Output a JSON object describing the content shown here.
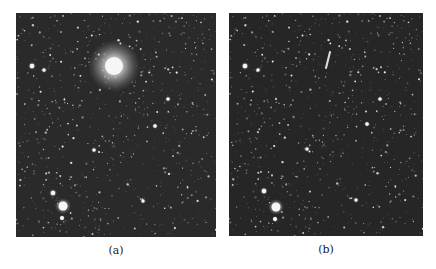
{
  "figure": {
    "panels": [
      {
        "id": "a",
        "caption": "(a)",
        "box": {
          "x": 16,
          "y": 13,
          "w": 200,
          "h": 224
        },
        "background": "#2a2a2a",
        "bright_sources": [
          {
            "x": 114,
            "y": 66,
            "r": 9,
            "glow": 26,
            "label": "bright-object"
          },
          {
            "x": 63,
            "y": 206,
            "r": 4.5,
            "glow": 8
          },
          {
            "x": 53,
            "y": 193,
            "r": 2.2,
            "glow": 4
          },
          {
            "x": 62,
            "y": 218,
            "r": 2.0,
            "glow": 3
          },
          {
            "x": 32,
            "y": 66,
            "r": 2.2,
            "glow": 4
          },
          {
            "x": 44,
            "y": 70,
            "r": 1.6,
            "glow": 3
          },
          {
            "x": 155,
            "y": 126,
            "r": 1.8,
            "glow": 3
          },
          {
            "x": 168,
            "y": 99,
            "r": 1.6,
            "glow": 3
          },
          {
            "x": 94,
            "y": 150,
            "r": 1.6,
            "glow": 3
          },
          {
            "x": 143,
            "y": 201,
            "r": 1.5,
            "glow": 3
          }
        ]
      },
      {
        "id": "b",
        "caption": "(b)",
        "box": {
          "x": 229,
          "y": 13,
          "w": 194,
          "h": 223
        },
        "background": "#262626",
        "bright_sources": [
          {
            "x": 276,
            "y": 207,
            "r": 4.5,
            "glow": 8
          },
          {
            "x": 264,
            "y": 191,
            "r": 2.2,
            "glow": 4
          },
          {
            "x": 275,
            "y": 219,
            "r": 2.0,
            "glow": 3
          },
          {
            "x": 245,
            "y": 66,
            "r": 2.2,
            "glow": 4
          },
          {
            "x": 258,
            "y": 70,
            "r": 1.6,
            "glow": 3
          },
          {
            "x": 367,
            "y": 124,
            "r": 1.8,
            "glow": 3
          },
          {
            "x": 380,
            "y": 99,
            "r": 1.6,
            "glow": 3
          },
          {
            "x": 307,
            "y": 149,
            "r": 1.6,
            "glow": 3
          },
          {
            "x": 356,
            "y": 200,
            "r": 1.5,
            "glow": 3
          }
        ],
        "streak": {
          "x1": 330,
          "y1": 52,
          "x2": 326,
          "y2": 68
        }
      }
    ]
  }
}
